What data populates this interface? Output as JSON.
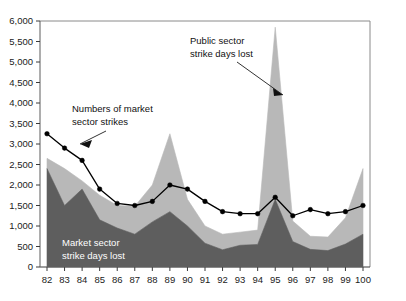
{
  "chart_data": {
    "type": "area",
    "title": "",
    "xlabel": "",
    "ylabel": "",
    "grid": false,
    "legend_position": "annotations",
    "ylim": [
      0,
      6000
    ],
    "ytick_labels": [
      "6,000",
      "5,500",
      "5,000",
      "4,500",
      "4,000",
      "3,500",
      "3,000",
      "2,500",
      "2,000",
      "1,500",
      "1,000",
      "500",
      "0"
    ],
    "ytick_values": [
      6000,
      5500,
      5000,
      4500,
      4000,
      3500,
      3000,
      2500,
      2000,
      1500,
      1000,
      500,
      0
    ],
    "categories": [
      "82",
      "83",
      "84",
      "85",
      "86",
      "87",
      "88",
      "89",
      "90",
      "91",
      "92",
      "93",
      "94",
      "95",
      "96",
      "97",
      "98",
      "99",
      "100"
    ],
    "series": [
      {
        "name": "Market sector strike days lost",
        "type": "area-stacked",
        "color": "#5e5e5e",
        "values": [
          2400,
          1500,
          1900,
          1150,
          950,
          800,
          1100,
          1350,
          1000,
          580,
          420,
          530,
          550,
          1650,
          620,
          430,
          400,
          560,
          800
        ]
      },
      {
        "name": "Public sector strike days lost",
        "type": "area-stacked",
        "color": "#b8b8b8",
        "values": [
          250,
          900,
          200,
          600,
          550,
          680,
          900,
          1900,
          650,
          420,
          380,
          320,
          350,
          4200,
          500,
          320,
          330,
          640,
          1600
        ]
      },
      {
        "name": "Numbers of market sector strikes",
        "type": "line",
        "color": "#000000",
        "values": [
          3250,
          2900,
          2600,
          1900,
          1550,
          1500,
          1600,
          2000,
          1900,
          1600,
          1350,
          1300,
          1300,
          1700,
          1250,
          1400,
          1300,
          1350,
          1500
        ]
      }
    ],
    "annotations": [
      {
        "name": "market-sector-strikes-annotation",
        "text_lines": [
          "Numbers of market",
          "sector strikes"
        ],
        "style": "dark"
      },
      {
        "name": "public-sector-days-annotation",
        "text_lines": [
          "Public sector",
          "strike days lost"
        ],
        "style": "dark"
      },
      {
        "name": "market-sector-days-annotation",
        "text_lines": [
          "Market sector",
          "strike days lost"
        ],
        "style": "light"
      }
    ]
  }
}
